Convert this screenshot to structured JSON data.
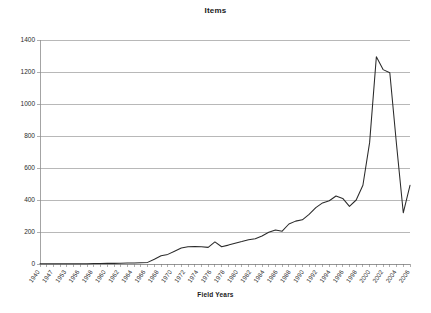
{
  "chart_data": {
    "type": "line",
    "title": "Items",
    "xlabel": "Field Years",
    "ylabel": "",
    "ylim": [
      0,
      1400
    ],
    "ytick_step": 200,
    "ytick_labels": [
      "0",
      "200",
      "400",
      "600",
      "800",
      "1000",
      "1200",
      "1400"
    ],
    "grid": true,
    "legend": "none",
    "xlabel_rotation_deg": -55,
    "xtick_labels_shown": [
      "1940",
      "1947",
      "1953",
      "1956",
      "1958",
      "1960",
      "1962",
      "1964",
      "1966",
      "1968",
      "1970",
      "1972",
      "1974",
      "1976",
      "1978",
      "1980",
      "1982",
      "1984",
      "1986",
      "1988",
      "1990",
      "1992",
      "1994",
      "1996",
      "1998",
      "2000",
      "2002",
      "2004",
      "2006"
    ],
    "series": [
      {
        "name": "Items",
        "x": [
          "1940",
          "1947",
          "1953",
          "1955",
          "1956",
          "1957",
          "1958",
          "1959",
          "1960",
          "1961",
          "1962",
          "1963",
          "1964",
          "1965",
          "1966",
          "1967",
          "1968",
          "1969",
          "1970",
          "1971",
          "1972",
          "1973",
          "1974",
          "1975",
          "1976",
          "1977",
          "1978",
          "1979",
          "1980",
          "1981",
          "1982",
          "1983",
          "1984",
          "1985",
          "1986",
          "1987",
          "1988",
          "1989",
          "1990",
          "1991",
          "1992",
          "1993",
          "1994",
          "1995",
          "1996",
          "1997",
          "1998",
          "1999",
          "2000",
          "2001",
          "2002",
          "2003",
          "2004",
          "2005",
          "2006",
          "2007"
        ],
        "values": [
          1,
          1,
          1,
          1,
          2,
          2,
          2,
          2,
          3,
          3,
          4,
          4,
          5,
          6,
          6,
          8,
          10,
          30,
          52,
          60,
          80,
          100,
          108,
          110,
          108,
          104,
          138,
          108,
          118,
          130,
          140,
          152,
          158,
          175,
          198,
          212,
          205,
          250,
          268,
          276,
          310,
          352,
          382,
          395,
          425,
          410,
          360,
          400,
          448,
          410,
          440,
          550,
          505,
          482,
          478,
          492
        ]
      }
    ],
    "annotations": {
      "peak_value": 1295,
      "peak_x": "2002",
      "plateau_value": 1195,
      "plateau_x": "2004",
      "final_value": 320
    },
    "late_segment": {
      "x": [
        "2000",
        "2001",
        "2002",
        "2003",
        "2004",
        "2005",
        "2006"
      ],
      "values": [
        492,
        760,
        1295,
        1215,
        1195,
        745,
        320
      ]
    }
  },
  "canvas": {
    "plot_left": 40,
    "plot_right": 410,
    "plot_top": 40,
    "plot_bottom": 264
  }
}
